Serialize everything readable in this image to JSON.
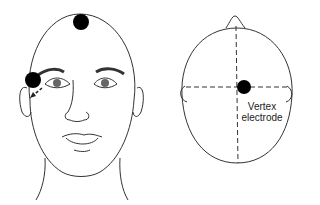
{
  "diagram": {
    "front_view": {
      "electrodes": [
        "vertex-top",
        "lateral-canthus"
      ]
    },
    "top_view": {
      "label_line1": "Vertex",
      "label_line2": "electrode"
    }
  }
}
